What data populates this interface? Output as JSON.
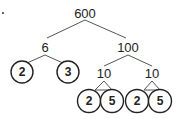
{
  "diagram": {
    "type": "factor-tree",
    "root": "600",
    "level1": {
      "left": "6",
      "right": "100"
    },
    "level2": {
      "left_primes": [
        "2",
        "3"
      ],
      "right_factors": [
        "10",
        "10"
      ]
    },
    "level3": {
      "primes": [
        "2",
        "5",
        "2",
        "5"
      ]
    }
  }
}
